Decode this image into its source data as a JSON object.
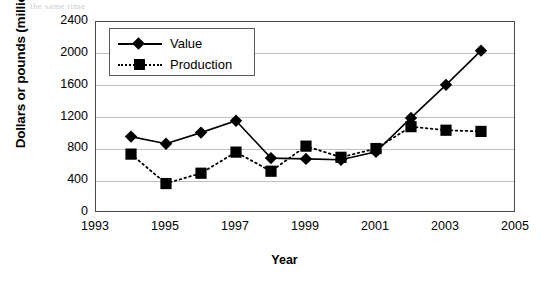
{
  "chart_data": {
    "type": "line",
    "title": "",
    "xlabel": "Year",
    "ylabel": "Dollars or pounds (millions)",
    "x": [
      1994,
      1995,
      1996,
      1997,
      1998,
      1999,
      2000,
      2001,
      2002,
      2003,
      2004
    ],
    "xlim": [
      1993,
      2005
    ],
    "ylim": [
      0,
      2400
    ],
    "xticks": [
      "1993",
      "1995",
      "1997",
      "1999",
      "2001",
      "2003",
      "2005"
    ],
    "yticks": [
      "0",
      "400",
      "800",
      "1200",
      "1600",
      "2000",
      "2400"
    ],
    "grid": "horizontal",
    "legend_position": "top-left",
    "series": [
      {
        "name": "Value",
        "marker": "diamond",
        "linestyle": "solid",
        "color": "#000000",
        "values": [
          960,
          870,
          1010,
          1160,
          690,
          680,
          670,
          770,
          1195,
          1610,
          2040
        ]
      },
      {
        "name": "Production",
        "marker": "square",
        "linestyle": "dotted",
        "color": "#000000",
        "values": [
          740,
          370,
          500,
          765,
          525,
          840,
          700,
          810,
          1085,
          1040,
          1025
        ]
      }
    ]
  },
  "axes": {
    "y_title": "Dollars or pounds (millions)",
    "x_title": "Year"
  },
  "legend": {
    "items": [
      {
        "label": "Value"
      },
      {
        "label": "Production"
      }
    ]
  },
  "ghost_text": {
    "top": "the same time"
  }
}
